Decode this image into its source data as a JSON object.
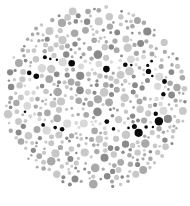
{
  "plate": {
    "type": "pseudoisochromatic-dot-plate",
    "figure": "curving dotted trail",
    "colors": {
      "background": "#ffffff",
      "dot_light": "#c8c8c8",
      "dot_mid": "#a9a9a9",
      "dot_dark": "#8a8a8a",
      "figure_dot": "#0a0a0a",
      "trail_dot": "#d9d9d9"
    }
  },
  "caption": {
    "text": ""
  }
}
